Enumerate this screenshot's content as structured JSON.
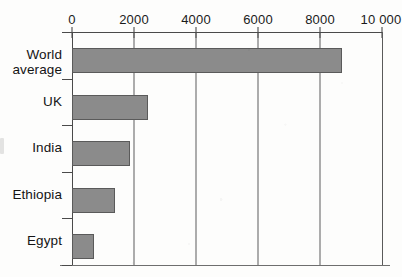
{
  "chart_data": {
    "type": "bar",
    "orientation": "horizontal",
    "title": "",
    "subtitle": "",
    "xlabel": "",
    "ylabel": "",
    "categories": [
      "World average",
      "UK",
      "India",
      "Ethiopia",
      "Egypt"
    ],
    "values": [
      8700,
      2450,
      1870,
      1390,
      710
    ],
    "series": [
      {
        "name": "",
        "values": [
          8700,
          2450,
          1870,
          1390,
          710
        ]
      }
    ],
    "xlim": [
      0,
      10000
    ],
    "x_ticks": [
      0,
      2000,
      4000,
      6000,
      8000,
      10000
    ],
    "x_tick_labels": [
      "0",
      "2000",
      "4000",
      "6000",
      "8000",
      "10 000"
    ],
    "grid": true,
    "grid_axis": "x",
    "legend": false,
    "legend_position": "none",
    "annotations": [],
    "bar_color": "#8b8b8b",
    "bar_edge_color": "#5a5a5a",
    "background_color": "#fdfdfc",
    "axis_color": "#4a4a4a"
  },
  "axis": {
    "x_tick_labels": [
      "0",
      "2000",
      "4000",
      "6000",
      "8000",
      "10 000"
    ]
  },
  "categories": [
    {
      "label": "World\naverage",
      "value": 8700
    },
    {
      "label": "UK",
      "value": 2450
    },
    {
      "label": "India",
      "value": 1870
    },
    {
      "label": "Ethiopia",
      "value": 1390
    },
    {
      "label": "Egypt",
      "value": 710
    }
  ]
}
